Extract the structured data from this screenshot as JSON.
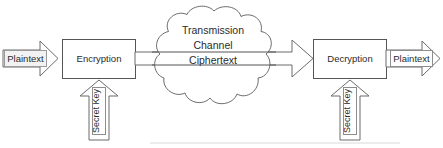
{
  "diagram": {
    "title_visible": false,
    "nodes": {
      "input_plaintext": {
        "label": "Plaintext"
      },
      "encryption": {
        "label": "Encryption"
      },
      "cloud": {
        "line1": "Transmission",
        "line2": "Channel",
        "line3": "Ciphertext"
      },
      "decryption": {
        "label": "Decryption"
      },
      "output_plaintext": {
        "label": "Plaintext"
      },
      "secret_key_left": {
        "label": "Secret Key"
      },
      "secret_key_right": {
        "label": "Secret Key"
      }
    },
    "icons": {
      "input_arrow": "right-arrow-icon",
      "channel_arrow": "right-arrow-icon",
      "output_arrow": "right-arrow-icon",
      "key_arrow_left": "up-arrow-icon",
      "key_arrow_right": "up-arrow-icon",
      "cloud": "cloud-icon"
    },
    "colors": {
      "background": "#ffffff",
      "line": "#555555",
      "cloud_line": "#6a6a6a",
      "text": "#2b2b2b",
      "tag_fill": "#f2f2f2",
      "tag_border": "#9a9a9a"
    }
  }
}
